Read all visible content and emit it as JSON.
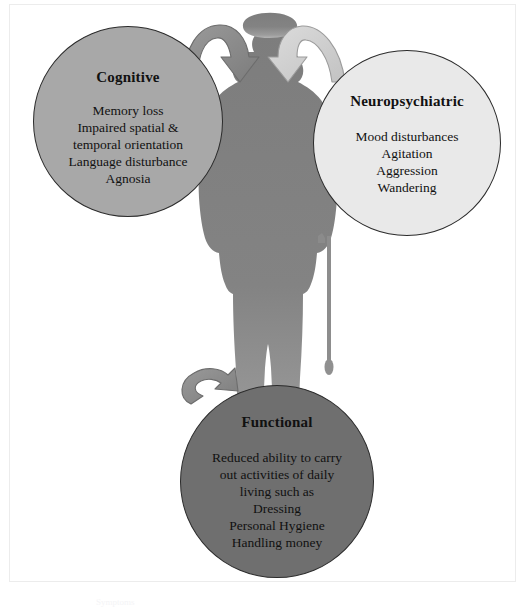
{
  "figure": {
    "alt_title": "Domains of dementia symptoms",
    "background_color": "#ffffff",
    "frame_color": "#ececec",
    "caption_fragment": "Symptoms"
  },
  "silhouette": {
    "name": "elderly-man-with-cane-silhouette",
    "color": "#808080",
    "cane_color": "#8a8a8a"
  },
  "bubbles": [
    {
      "id": "cognitive",
      "title": "Cognitive",
      "fill": "#a8a8a8",
      "stroke": "#2b2b2b",
      "items": [
        "Memory loss",
        "Impaired spatial &",
        "temporal orientation",
        "Language disturbance",
        "Agnosia"
      ]
    },
    {
      "id": "neuropsychiatric",
      "title": "Neuropsychiatric",
      "fill": "#e9e9e9",
      "stroke": "#2b2b2b",
      "items": [
        "Mood disturbances",
        "Agitation",
        "Aggression",
        "Wandering"
      ]
    },
    {
      "id": "functional",
      "title": "Functional",
      "fill": "#6f6f6f",
      "stroke": "#2b2b2b",
      "items": [
        "Reduced ability to carry",
        "out activities of daily",
        "living such as",
        "Dressing",
        "Personal Hygiene",
        "Handling money"
      ]
    }
  ],
  "arrows": [
    {
      "id": "arrow-cognitive-to-center",
      "from": "cognitive",
      "to": "center-figure",
      "fill": "#8e8e8e",
      "stroke": "#5d5d5d",
      "direction": "down-right"
    },
    {
      "id": "arrow-neuropsychiatric-to-center",
      "from": "neuropsychiatric",
      "to": "center-figure",
      "fill": "#d0d0d0",
      "stroke": "#8a8a8a",
      "direction": "down-left"
    },
    {
      "id": "arrow-functional-to-center",
      "from": "functional",
      "to": "center-figure",
      "fill": "#8e8e8e",
      "stroke": "#5d5d5d",
      "direction": "up-right"
    }
  ]
}
